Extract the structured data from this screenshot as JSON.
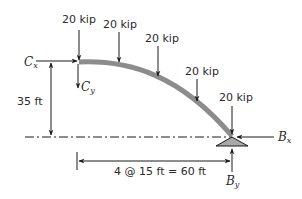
{
  "diagram": {
    "type": "arch-free-body-diagram",
    "loads": [
      {
        "label": "20 kip",
        "x": 79,
        "y_top": 30,
        "y_tip": 61
      },
      {
        "label": "20 kip",
        "x": 119,
        "y_top": 32,
        "y_tip": 63
      },
      {
        "label": "20 kip",
        "x": 158,
        "y_top": 46,
        "y_tip": 78
      },
      {
        "label": "20 kip",
        "x": 197,
        "y_top": 79,
        "y_tip": 103
      },
      {
        "label": "20 kip",
        "x": 232,
        "y_top": 106,
        "y_tip": 135
      }
    ],
    "reactions": {
      "cx": {
        "main": "C",
        "sub": "x"
      },
      "cy": {
        "main": "C",
        "sub": "y"
      },
      "bx": {
        "main": "B",
        "sub": "x"
      },
      "by": {
        "main": "B",
        "sub": "y"
      }
    },
    "dimensions": {
      "height": "35 ft",
      "span": "4 @ 15 ft = 60 ft"
    },
    "colors": {
      "arch": "#8c8c8c",
      "support": "#a8a8a8",
      "line": "#1a1a1a"
    }
  }
}
